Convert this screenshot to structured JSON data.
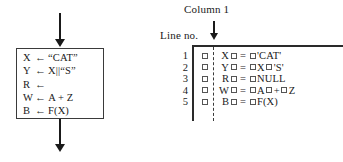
{
  "flowchart": {
    "name": "assignment-process-block",
    "in_arrow": "arrow-down-icon",
    "out_arrow": "arrow-down-icon",
    "statements": [
      {
        "target": "X",
        "operator": "←",
        "expression": "“CAT”"
      },
      {
        "target": "Y",
        "operator": "←",
        "expression": "X||“S”"
      },
      {
        "target": "R",
        "operator": "←",
        "expression": ""
      },
      {
        "target": "W",
        "operator": "←",
        "expression": "A + Z"
      },
      {
        "target": "B",
        "operator": "←",
        "expression": "F(X)"
      }
    ]
  },
  "listing": {
    "column_label": "Column 1",
    "column_arrow": "arrow-down-icon",
    "lineno_label": "Line no.",
    "line_numbers": [
      "1",
      "2",
      "3",
      "4",
      "5"
    ],
    "blank_marker": "□",
    "code_lines": [
      {
        "n": "1",
        "target": "X",
        "eq": "=",
        "expr_parts": [
          "'CAT'"
        ]
      },
      {
        "n": "2",
        "target": "Y",
        "eq": "=",
        "expr_parts": [
          "X",
          "'S'"
        ]
      },
      {
        "n": "3",
        "target": "R",
        "eq": "=",
        "expr_parts": [
          "NULL"
        ]
      },
      {
        "n": "4",
        "target": "W",
        "eq": "=",
        "expr_parts": [
          "A",
          "+",
          "Z"
        ]
      },
      {
        "n": "5",
        "target": "B",
        "eq": "=",
        "expr_parts": [
          "F(X)"
        ]
      }
    ],
    "code_text": [
      "□ X□ = □'CAT'",
      "□ Y□ = □X□'S'",
      "□ R□ = □NULL",
      "□ W□ = □A□ + □Z",
      "□ B□ = □F(X)"
    ]
  },
  "colors": {
    "ink": "#1a1a1a",
    "rule": "#2a2a2a",
    "box_border": "#3a3a3a",
    "background": "#ffffff"
  }
}
